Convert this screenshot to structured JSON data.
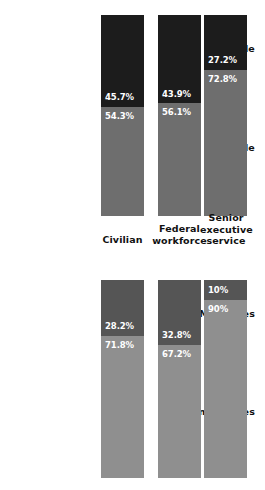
{
  "chart_data": [
    {
      "type": "bar",
      "title": "Gender composition",
      "stacked": true,
      "orientation": "vertical",
      "xlabel": "",
      "ylabel": "",
      "ylim": [
        0,
        100
      ],
      "grid": false,
      "legend_position": "left-row-labels",
      "categories": [
        "Civilian",
        "Federal workforce",
        "Senior executive service"
      ],
      "series": [
        {
          "name": "Female",
          "values": [
            45.7,
            43.9,
            27.2
          ],
          "color": "#1c1c1c"
        },
        {
          "name": "Male",
          "values": [
            54.3,
            56.1,
            72.8
          ],
          "color": "#6e6e6e"
        }
      ],
      "data_labels": [
        [
          "45.7%",
          "43.9%",
          "27.2%"
        ],
        [
          "54.3%",
          "56.1%",
          "72.8%"
        ]
      ]
    },
    {
      "type": "bar",
      "title": "Ethnicity composition",
      "stacked": true,
      "orientation": "vertical",
      "xlabel": "",
      "ylabel": "",
      "ylim": [
        0,
        100
      ],
      "grid": false,
      "legend_position": "left-row-labels",
      "categories": [
        "Civilian",
        "Federal workforce",
        "Senior executive service"
      ],
      "series": [
        {
          "name": "Minorities",
          "values": [
            28.2,
            32.8,
            10.0
          ],
          "color": "#555555"
        },
        {
          "name": "Nonminorities",
          "values": [
            71.8,
            67.2,
            90.0
          ],
          "color": "#8f8f8f"
        }
      ],
      "data_labels": [
        [
          "28.2%",
          "32.8%",
          "10%"
        ],
        [
          "71.8%",
          "67.2%",
          "90%"
        ]
      ]
    }
  ],
  "panels": {
    "gender": {
      "series_labels": {
        "top": "Female",
        "bottom": "Male"
      },
      "bars": [
        {
          "category": "Civilian",
          "top_value": "45.7%",
          "bottom_value": "54.3%",
          "top_pct": 45.7,
          "bottom_pct": 54.3
        },
        {
          "category": "Federal workforce",
          "top_value": "43.9%",
          "bottom_value": "56.1%",
          "top_pct": 43.9,
          "bottom_pct": 56.1
        },
        {
          "category": "Senior executive service",
          "top_value": "27.2%",
          "bottom_value": "72.8%",
          "top_pct": 27.2,
          "bottom_pct": 72.8
        }
      ]
    },
    "ethnicity": {
      "series_labels": {
        "top": "Minorities",
        "bottom": "Nonminorities"
      },
      "bars": [
        {
          "category": "Civilian",
          "top_value": "28.2%",
          "bottom_value": "71.8%",
          "top_pct": 28.2,
          "bottom_pct": 71.8
        },
        {
          "category": "Federal workforce",
          "top_value": "32.8%",
          "bottom_value": "67.2%",
          "top_pct": 32.8,
          "bottom_pct": 67.2
        },
        {
          "category": "Senior executive service",
          "top_value": "10%",
          "bottom_value": "90%",
          "top_pct": 10.0,
          "bottom_pct": 90.0
        }
      ]
    }
  },
  "category_labels": {
    "civilian": "Civilian",
    "federal_workforce": "Federal workforce",
    "senior_executive_service": "Senior executive service"
  },
  "colors": {
    "gender_top": "#1c1c1c",
    "gender_bottom": "#6e6e6e",
    "ethnicity_top": "#555555",
    "ethnicity_bottom": "#8f8f8f",
    "background": "#ffffff",
    "label_text": "#111111",
    "value_text": "#ffffff"
  }
}
